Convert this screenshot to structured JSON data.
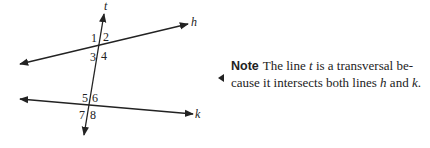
{
  "figure": {
    "lines": [
      {
        "name": "h",
        "label": "h"
      },
      {
        "name": "k",
        "label": "k"
      },
      {
        "name": "t",
        "label": "t"
      }
    ],
    "angles": [
      "1",
      "2",
      "3",
      "4",
      "5",
      "6",
      "7",
      "8"
    ]
  },
  "note": {
    "heading": "Note",
    "text_1": "The line ",
    "var_t": "t",
    "text_2": " is a transversal be-cause it intersects both lines ",
    "var_h": "h",
    "text_3": " and ",
    "var_k": "k",
    "text_4": "."
  },
  "colors": {
    "ink": "#222222",
    "background": "#ffffff"
  }
}
